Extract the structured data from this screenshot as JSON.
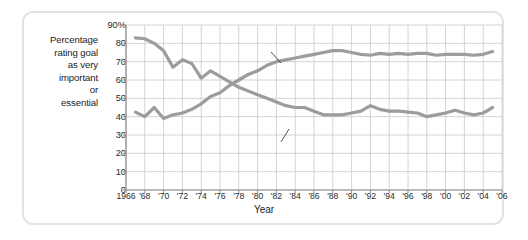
{
  "axis": {
    "y_label_lines": [
      "Percentage",
      "rating goal",
      "as very",
      "important",
      "or",
      "essential"
    ],
    "y_ticks": [
      "90%",
      "80",
      "70",
      "60",
      "50",
      "40",
      "30",
      "20",
      "10",
      "0"
    ],
    "x_ticks": [
      "1966",
      "'68",
      "'70",
      "'72",
      "'74",
      "'76",
      "'78",
      "'80",
      "'82",
      "'84",
      "'86",
      "'88",
      "'90",
      "'92",
      "'94",
      "'96",
      "'98",
      "'00",
      "'02",
      "'04",
      "'06"
    ],
    "x_title": "Year"
  },
  "annotations": {
    "financial": "Being very well-off financially",
    "philosophy": "Developing a meaningful life philosophy"
  },
  "colors": {
    "line": "#9c9c9c",
    "grid": "#c9c9c9",
    "axis": "#8c8c8c",
    "frame": "#e3e3e3",
    "text": "#1c1c1c",
    "background": "#ffffff"
  },
  "chart_data": {
    "type": "line",
    "title": "",
    "xlabel": "Year",
    "ylabel": "Percentage rating goal as very important or essential",
    "xlim": [
      1966,
      2006
    ],
    "ylim": [
      0,
      90
    ],
    "grid": true,
    "legend": "inline-annotations",
    "x": [
      1967,
      1968,
      1969,
      1970,
      1971,
      1972,
      1973,
      1974,
      1975,
      1976,
      1977,
      1978,
      1979,
      1980,
      1981,
      1982,
      1983,
      1984,
      1985,
      1986,
      1987,
      1988,
      1989,
      1990,
      1991,
      1992,
      1993,
      1994,
      1995,
      1996,
      1997,
      1998,
      1999,
      2000,
      2001,
      2002,
      2003,
      2004,
      2005
    ],
    "series": [
      {
        "name": "Developing a meaningful life philosophy",
        "values": [
          83,
          82.5,
          80,
          76,
          67,
          71,
          69,
          61,
          65,
          62,
          59,
          56,
          54,
          52,
          50,
          48,
          46,
          45,
          45,
          43,
          41,
          41,
          41,
          42,
          43,
          46,
          44,
          43,
          43,
          42.5,
          42,
          40,
          41,
          42,
          43.5,
          42,
          41,
          42,
          45
        ]
      },
      {
        "name": "Being very well-off financially",
        "values": [
          42.5,
          40,
          45,
          39,
          41,
          42,
          44,
          47,
          51,
          53,
          57,
          60,
          63,
          65,
          68,
          70,
          71,
          72,
          73,
          74,
          75,
          76,
          76,
          75,
          74,
          73.5,
          74.5,
          74,
          74.5,
          74,
          74.5,
          74.5,
          73.5,
          74,
          74,
          74,
          73.5,
          74,
          75.5
        ]
      }
    ]
  }
}
